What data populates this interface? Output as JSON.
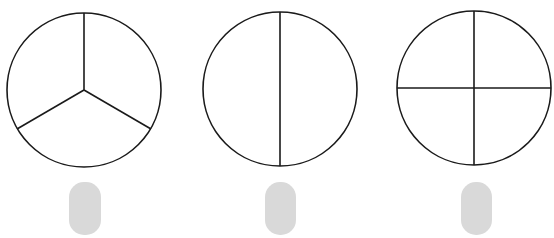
{
  "diagram": {
    "stroke_color": "#1a1a1a",
    "answer_box_color": "#d9d9d9",
    "circles": [
      {
        "id": "circle-thirds",
        "parts": 3,
        "cx": 84,
        "cy": 90,
        "r": 77
      },
      {
        "id": "circle-halves",
        "parts": 2,
        "cx": 280,
        "cy": 89,
        "r": 77
      },
      {
        "id": "circle-quarters",
        "parts": 4,
        "cx": 474,
        "cy": 88,
        "r": 77
      }
    ],
    "answer_boxes": [
      {
        "id": "answer-box-1",
        "value": ""
      },
      {
        "id": "answer-box-2",
        "value": ""
      },
      {
        "id": "answer-box-3",
        "value": ""
      }
    ]
  }
}
